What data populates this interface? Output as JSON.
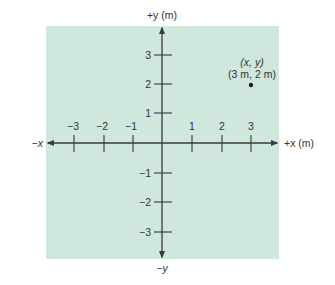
{
  "diagram": {
    "type": "cartesian-coordinate-plane",
    "colors": {
      "panel_fill": "#cfe7dd",
      "axis": "#3a3a3a",
      "text": "#333333",
      "point": "#222222"
    },
    "axes": {
      "x_positive_label": "+x (m)",
      "x_negative_label": "−x",
      "y_positive_label": "+y (m)",
      "y_negative_label": "−y",
      "x_ticks": [
        {
          "value": -3,
          "label": "−3"
        },
        {
          "value": -2,
          "label": "−2"
        },
        {
          "value": -1,
          "label": "−1"
        },
        {
          "value": 1,
          "label": "1"
        },
        {
          "value": 2,
          "label": "2"
        },
        {
          "value": 3,
          "label": "3"
        }
      ],
      "y_ticks": [
        {
          "value": 3,
          "label": "3"
        },
        {
          "value": 2,
          "label": "2"
        },
        {
          "value": 1,
          "label": "1"
        },
        {
          "value": -1,
          "label": "−1"
        },
        {
          "value": -2,
          "label": "−2"
        },
        {
          "value": -3,
          "label": "−3"
        }
      ]
    },
    "point": {
      "x": 3,
      "y": 2,
      "label_symbolic": "(x, y)",
      "label_values": "(3 m, 2 m)"
    }
  }
}
